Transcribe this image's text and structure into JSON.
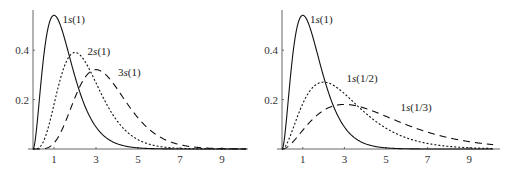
{
  "chart_data": [
    {
      "type": "line",
      "title": "",
      "xlabel": "",
      "ylabel": "",
      "xlim": [
        0,
        10.2
      ],
      "ylim": [
        0,
        0.56
      ],
      "grid": false,
      "legend": "inline curve labels",
      "x_ticks": [
        "1",
        "3",
        "5",
        "7",
        "9"
      ],
      "y_ticks": [
        "0.2",
        "0.4"
      ],
      "x": [
        0,
        0.5,
        1,
        1.5,
        2,
        2.5,
        3,
        3.5,
        4,
        4.5,
        5,
        6,
        7,
        8,
        9,
        10
      ],
      "series": [
        {
          "name": "1s(1)",
          "style": "solid",
          "formula": {
            "N": 4,
            "p": 2,
            "a": 2
          },
          "values": [
            0,
            0.368,
            0.541,
            0.448,
            0.293,
            0.168,
            0.089,
            0.045,
            0.021,
            0.01,
            0.005,
            0.001,
            0,
            0,
            0,
            0
          ]
        },
        {
          "name": "2s(1)",
          "style": "dotted",
          "formula": {
            "N": 1.3333,
            "p": 4,
            "a": 2
          },
          "values": [
            0,
            0.031,
            0.18,
            0.336,
            0.391,
            0.352,
            0.269,
            0.182,
            0.115,
            0.067,
            0.038,
            0.011,
            0.003,
            0.001,
            0,
            0
          ]
        },
        {
          "name": "3s(1)",
          "style": "dashed",
          "formula": {
            "N": 0.17778,
            "p": 6,
            "a": 2
          },
          "values": [
            0,
            0.001,
            0.024,
            0.101,
            0.208,
            0.292,
            0.321,
            0.298,
            0.245,
            0.183,
            0.127,
            0.053,
            0.02,
            0.007,
            0.002,
            0.001
          ]
        }
      ],
      "annotations": [
        {
          "text": "1s(1)",
          "x": 1.4,
          "y": 0.51
        },
        {
          "text": "2s(1)",
          "x": 2.6,
          "y": 0.38
        },
        {
          "text": "3s(1)",
          "x": 4.05,
          "y": 0.295
        }
      ]
    },
    {
      "type": "line",
      "title": "",
      "xlabel": "",
      "ylabel": "",
      "xlim": [
        0,
        10.2
      ],
      "ylim": [
        0,
        0.56
      ],
      "grid": false,
      "legend": "inline curve labels",
      "x_ticks": [
        "1",
        "3",
        "5",
        "7",
        "9"
      ],
      "y_ticks": [
        "0.2",
        "0.4"
      ],
      "x": [
        0,
        0.5,
        1,
        1.5,
        2,
        2.5,
        3,
        3.5,
        4,
        4.5,
        5,
        6,
        7,
        8,
        9,
        10
      ],
      "series": [
        {
          "name": "1s(1)",
          "style": "solid",
          "formula": {
            "N": 4,
            "p": 2,
            "a": 2
          },
          "values": [
            0,
            0.368,
            0.541,
            0.448,
            0.293,
            0.168,
            0.089,
            0.045,
            0.021,
            0.01,
            0.005,
            0.001,
            0,
            0,
            0,
            0
          ]
        },
        {
          "name": "1s(1/2)",
          "style": "dotted",
          "formula": {
            "N": 0.5,
            "p": 2,
            "a": 1
          },
          "values": [
            0,
            0.076,
            0.184,
            0.251,
            0.271,
            0.256,
            0.224,
            0.185,
            0.147,
            0.112,
            0.084,
            0.045,
            0.022,
            0.011,
            0.005,
            0.002
          ]
        },
        {
          "name": "1s(1/3)",
          "style": "dashed",
          "formula": {
            "N": 0.148148,
            "p": 2,
            "a": 0.666667
          },
          "values": [
            0,
            0.027,
            0.076,
            0.123,
            0.157,
            0.175,
            0.18,
            0.176,
            0.165,
            0.15,
            0.133,
            0.099,
            0.069,
            0.046,
            0.03,
            0.019
          ]
        }
      ],
      "annotations": [
        {
          "text": "1s(1)",
          "x": 1.35,
          "y": 0.51
        },
        {
          "text": "1s(1/2)",
          "x": 3.1,
          "y": 0.27
        },
        {
          "text": "1s(1/3)",
          "x": 5.7,
          "y": 0.155
        }
      ]
    }
  ],
  "panels": [
    {
      "origin": [
        33,
        149
      ],
      "xscale": 21.0,
      "yscale": 247,
      "xmax_px": 248,
      "ytop_px": 10
    },
    {
      "origin": [
        282,
        149
      ],
      "xscale": 20.8,
      "yscale": 247,
      "xmax_px": 500,
      "ytop_px": 10
    }
  ]
}
